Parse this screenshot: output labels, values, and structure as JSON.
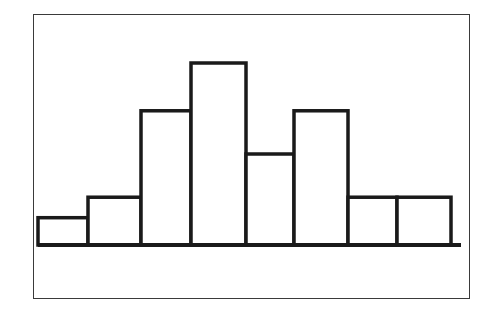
{
  "chart_data": {
    "type": "bar",
    "title": "",
    "xlabel": "",
    "ylabel": "",
    "categories": [
      "1",
      "2",
      "3",
      "4",
      "5",
      "6",
      "7",
      "8"
    ],
    "values": [
      1.2,
      2.1,
      5.9,
      8.0,
      4.0,
      5.9,
      2.1,
      2.1
    ],
    "values_note": "Relative heights estimated from pixel measurements; the chart has no axis scale or labels, so these are not true counts.",
    "grid": false,
    "legend": null,
    "style": {
      "fill": "#ffffff",
      "stroke": "#1a1a1a",
      "frame": "#3a3a3a"
    }
  }
}
